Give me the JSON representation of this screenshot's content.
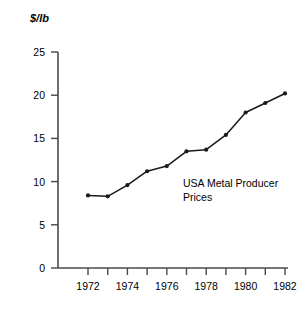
{
  "chart_data": {
    "type": "line",
    "title": "",
    "annotation": "USA Metal Producer Prices",
    "annotation_lines": [
      "USA Metal Producer",
      "Prices"
    ],
    "xlabel": "",
    "ylabel": "$/lb",
    "x": [
      1972,
      1973,
      1974,
      1975,
      1976,
      1977,
      1978,
      1979,
      1980,
      1981,
      1982
    ],
    "values": [
      8.4,
      8.3,
      9.6,
      11.2,
      11.8,
      13.5,
      13.7,
      15.4,
      18.0,
      19.1,
      20.2
    ],
    "series": [
      {
        "name": "USA Metal Producer Prices",
        "values": [
          8.4,
          8.3,
          9.6,
          11.2,
          11.8,
          13.5,
          13.7,
          15.4,
          18.0,
          19.1,
          20.2
        ]
      }
    ],
    "xlim": [
      1972,
      1982
    ],
    "ylim": [
      0,
      25
    ],
    "y_ticks": [
      0,
      5,
      10,
      15,
      20,
      25
    ],
    "y_tick_labels": [
      "0",
      "5",
      "10",
      "15",
      "20",
      "25"
    ],
    "x_ticks": [
      1972,
      1973,
      1974,
      1975,
      1976,
      1977,
      1978,
      1979,
      1980,
      1981,
      1982
    ],
    "x_tick_labels": [
      "1972",
      "",
      "1974",
      "",
      "1976",
      "",
      "1978",
      "",
      "1980",
      "",
      "1982"
    ],
    "x_labeled_ticks": [
      "1972",
      "1974",
      "1976",
      "1978",
      "1980",
      "1982"
    ],
    "grid": false,
    "legend": false,
    "marker": "dot",
    "line_color": "#1a1a1a",
    "marker_color": "#1a1a1a",
    "axis_color": "#4a4a4a",
    "background_color": "#ffffff"
  },
  "axis": {
    "y_title": "$/lb",
    "y_labels": [
      "25",
      "20",
      "15",
      "10",
      "5",
      "0"
    ],
    "x_labels": [
      "1972",
      "1974",
      "1976",
      "1978",
      "1980",
      "1982"
    ]
  },
  "annotation": {
    "line1": "USA Metal Producer",
    "line2": "Prices"
  }
}
